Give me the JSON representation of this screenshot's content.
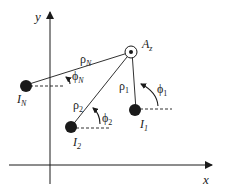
{
  "axes": {
    "x_label": "x",
    "y_label": "y"
  },
  "receiver": {
    "label": "A",
    "subscript": "z"
  },
  "sources": [
    {
      "id": "I_N",
      "label": "I",
      "subscript": "N",
      "rho": "ρ",
      "rho_sub": "N",
      "phi": "ϕ",
      "phi_sub": "N"
    },
    {
      "id": "I_2",
      "label": "I",
      "subscript": "2",
      "rho": "ρ",
      "rho_sub": "2",
      "phi": "ϕ",
      "phi_sub": "2"
    },
    {
      "id": "I_1",
      "label": "I",
      "subscript": "1",
      "rho": "ρ",
      "rho_sub": "1",
      "phi": "ϕ",
      "phi_sub": "1"
    }
  ],
  "colors": {
    "ink": "#1a1a1a",
    "background": "#ffffff"
  }
}
